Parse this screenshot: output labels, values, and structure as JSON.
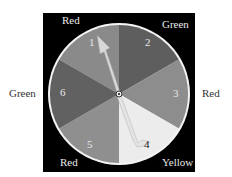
{
  "spinner": {
    "segments": [
      {
        "number": "1",
        "color_label": "Red",
        "fill": "#8a8a8a"
      },
      {
        "number": "2",
        "color_label": "Green",
        "fill": "#5e5e5e"
      },
      {
        "number": "3",
        "color_label": "Red",
        "fill": "#8d8d8d"
      },
      {
        "number": "4",
        "color_label": "Yellow",
        "fill": "#ececec"
      },
      {
        "number": "5",
        "color_label": "Red",
        "fill": "#8f8f8f"
      },
      {
        "number": "6",
        "color_label": "Green",
        "fill": "#616161"
      }
    ],
    "outer_labels": {
      "top_left": "Red",
      "top_right": "Green",
      "right": "Red",
      "bottom_right": "Yellow",
      "bottom_left": "Red",
      "left": "Green"
    },
    "pointer_points_to": "1"
  }
}
